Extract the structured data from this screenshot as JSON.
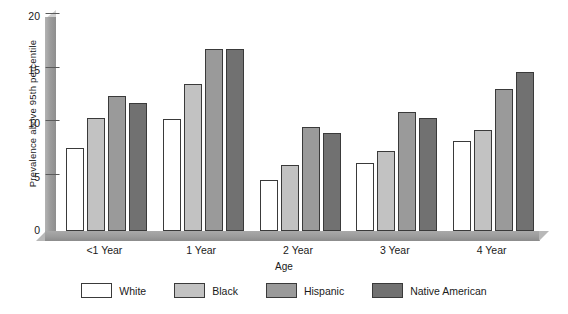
{
  "chart_data": {
    "type": "bar",
    "title": "",
    "xlabel": "Age",
    "ylabel": "Prevalence above 95th percentile",
    "categories": [
      "<1 Year",
      "1 Year",
      "2 Year",
      "3 Year",
      "4 Year"
    ],
    "yticks": [
      0,
      5,
      10,
      15,
      20
    ],
    "ylim": [
      0,
      20
    ],
    "grid": false,
    "legend_position": "bottom",
    "series": [
      {
        "name": "White",
        "color": "#ffffff",
        "values": [
          7.8,
          10.5,
          4.8,
          6.4,
          8.4
        ]
      },
      {
        "name": "Black",
        "color": "#c2c2c2",
        "values": [
          10.6,
          13.7,
          6.2,
          7.5,
          9.4
        ]
      },
      {
        "name": "Hispanic",
        "color": "#9a9a9a",
        "values": [
          12.6,
          17.0,
          9.7,
          11.1,
          13.3
        ]
      },
      {
        "name": "Native American",
        "color": "#717171",
        "values": [
          12.0,
          17.0,
          9.2,
          10.6,
          14.9
        ]
      }
    ]
  },
  "axes": {
    "y_title": "Prevalence above 95th percentile",
    "x_title": "Age",
    "y_tick_labels": [
      "20",
      "15",
      "10",
      "5",
      "0"
    ]
  },
  "legend": {
    "items": [
      {
        "label": "White"
      },
      {
        "label": "Black"
      },
      {
        "label": "Hispanic"
      },
      {
        "label": "Native American"
      }
    ]
  }
}
